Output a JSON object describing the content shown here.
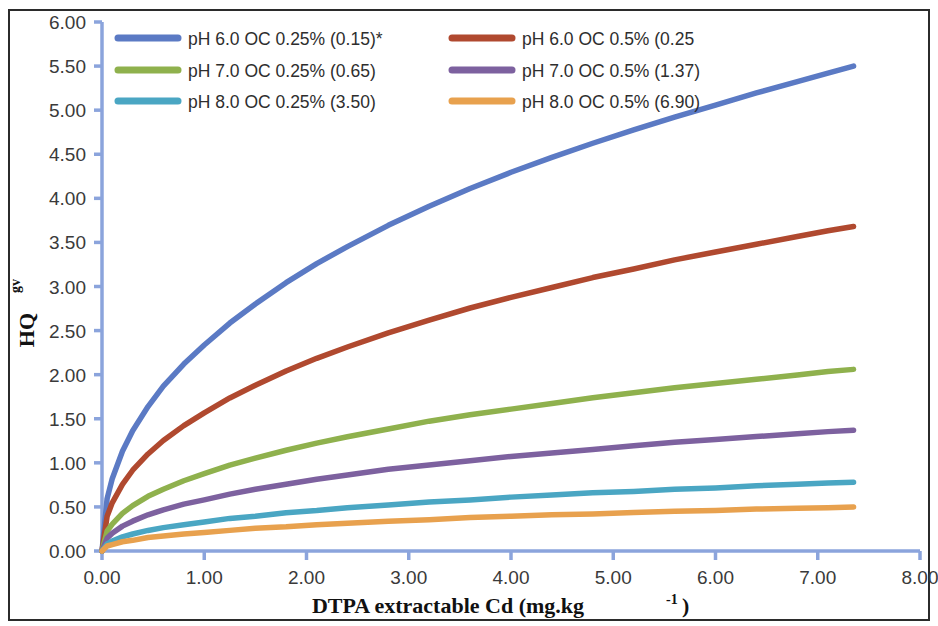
{
  "chart_data": {
    "type": "line",
    "title": "",
    "xlabel": "DTPA extractable Cd (mg.kg-1)",
    "xlabel_main": "DTPA extractable Cd (mg.kg",
    "xlabel_sup": "-1",
    "xlabel_tail": ")",
    "ylabel": "HQgv",
    "ylabel_main": "HQ",
    "ylabel_sub": "gv",
    "xlim": [
      0.0,
      8.0
    ],
    "ylim": [
      0.0,
      6.0
    ],
    "xticks": [
      "0.00",
      "1.00",
      "2.00",
      "3.00",
      "4.00",
      "5.00",
      "6.00",
      "7.00",
      "8.00"
    ],
    "xtick_values": [
      0.0,
      1.0,
      2.0,
      3.0,
      4.0,
      5.0,
      6.0,
      7.0,
      8.0
    ],
    "yticks": [
      "0.00",
      "0.50",
      "1.00",
      "1.50",
      "2.00",
      "2.50",
      "3.00",
      "3.50",
      "4.00",
      "4.50",
      "5.00",
      "5.50",
      "6.00"
    ],
    "ytick_values": [
      0.0,
      0.5,
      1.0,
      1.5,
      2.0,
      2.5,
      3.0,
      3.5,
      4.0,
      4.5,
      5.0,
      5.5,
      6.0
    ],
    "grid": false,
    "legend_position": "top-inside",
    "x_data": [
      0.0,
      0.05,
      0.1,
      0.2,
      0.3,
      0.45,
      0.6,
      0.8,
      1.0,
      1.25,
      1.5,
      1.8,
      2.1,
      2.4,
      2.8,
      3.2,
      3.6,
      4.0,
      4.4,
      4.8,
      5.2,
      5.6,
      6.0,
      6.4,
      6.8,
      7.1,
      7.35
    ],
    "series": [
      {
        "name": "pH 6.0 OC 0.25% (0.15)*",
        "label": "pH 6.0 OC 0.25% (0.15)*",
        "color": "#5b7ac4",
        "endpoint": 5.5,
        "values": [
          0.0,
          0.74,
          1.02,
          1.41,
          1.7,
          2.04,
          2.33,
          2.64,
          2.91,
          3.22,
          3.49,
          3.79,
          4.06,
          4.3,
          4.6,
          4.87,
          5.12,
          5.35,
          5.56,
          5.76,
          5.95,
          6.13,
          6.3,
          6.47,
          6.63,
          6.75,
          6.85
        ]
      },
      {
        "name": "pH 6.0 OC 0.5% (0.25",
        "label": "pH 6.0 OC 0.5% (0.25",
        "color": "#b0492f",
        "endpoint": 3.68,
        "values": [
          0.0,
          0.49,
          0.68,
          0.94,
          1.14,
          1.37,
          1.56,
          1.77,
          1.95,
          2.16,
          2.34,
          2.54,
          2.72,
          2.88,
          3.08,
          3.26,
          3.43,
          3.58,
          3.72,
          3.86,
          3.98,
          4.11,
          4.22,
          4.33,
          4.44,
          4.52,
          4.58
        ]
      },
      {
        "name": "pH 7.0 OC 0.25% (0.65)",
        "label": "pH 7.0 OC 0.25% (0.65)",
        "color": "#8fb14d",
        "endpoint": 2.06,
        "values": [
          0.0,
          0.28,
          0.38,
          0.53,
          0.64,
          0.77,
          0.87,
          0.99,
          1.09,
          1.21,
          1.31,
          1.42,
          1.52,
          1.61,
          1.72,
          1.83,
          1.92,
          2.0,
          2.08,
          2.16,
          2.23,
          2.3,
          2.36,
          2.42,
          2.48,
          2.53,
          2.56
        ]
      },
      {
        "name": "pH 7.0 OC 0.5% (1.37)",
        "label": "pH 7.0 OC 0.5% (1.37)",
        "color": "#7d619f",
        "endpoint": 1.37,
        "values": [
          0.0,
          0.18,
          0.25,
          0.35,
          0.42,
          0.51,
          0.58,
          0.66,
          0.72,
          0.8,
          0.87,
          0.94,
          1.01,
          1.07,
          1.15,
          1.21,
          1.27,
          1.33,
          1.38,
          1.43,
          1.48,
          1.53,
          1.57,
          1.61,
          1.65,
          1.68,
          1.7
        ]
      },
      {
        "name": "pH 8.0 OC 0.25% (3.50)",
        "label": "pH 8.0 OC 0.25% (3.50)",
        "color": "#4aa6c3",
        "endpoint": 0.78,
        "values": [
          0.0,
          0.1,
          0.14,
          0.2,
          0.24,
          0.29,
          0.33,
          0.37,
          0.41,
          0.46,
          0.49,
          0.54,
          0.57,
          0.61,
          0.65,
          0.69,
          0.72,
          0.76,
          0.79,
          0.82,
          0.84,
          0.87,
          0.89,
          0.92,
          0.94,
          0.96,
          0.97
        ]
      },
      {
        "name": "pH 8.0 OC 0.5% (6.90)",
        "label": "pH 8.0 OC 0.5% (6.90)",
        "color": "#e8a14e",
        "endpoint": 0.5,
        "values": [
          0.0,
          0.07,
          0.09,
          0.13,
          0.15,
          0.19,
          0.21,
          0.24,
          0.26,
          0.29,
          0.32,
          0.34,
          0.37,
          0.39,
          0.42,
          0.44,
          0.47,
          0.49,
          0.51,
          0.52,
          0.54,
          0.56,
          0.57,
          0.59,
          0.6,
          0.61,
          0.62
        ]
      }
    ],
    "axis_color": "#8ba4dc",
    "note": "* indicates reference"
  },
  "legend": {
    "rows": [
      [
        "pH 6.0 OC 0.25% (0.15)*",
        "pH 6.0 OC 0.5% (0.25"
      ],
      [
        "pH 7.0 OC 0.25% (0.65)",
        "pH 7.0 OC 0.5% (1.37)"
      ],
      [
        "pH 8.0 OC 0.25% (3.50)",
        "pH 8.0 OC 0.5% (6.90)"
      ]
    ]
  }
}
